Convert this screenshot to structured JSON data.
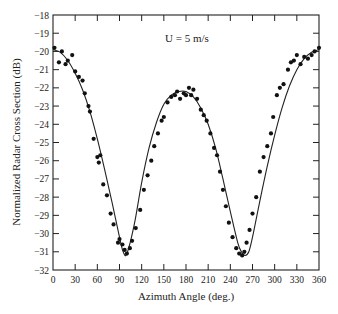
{
  "chart_data": {
    "type": "scatter",
    "title": "",
    "annotation": "U = 5 m/s",
    "xlabel": "Azimuth Angle (deg.)",
    "ylabel": "Normalized Radar Cross Section (dB)",
    "xlim": [
      0,
      360
    ],
    "ylim": [
      -32,
      -18
    ],
    "xticks": [
      0,
      30,
      60,
      90,
      120,
      150,
      180,
      210,
      240,
      270,
      300,
      330,
      360
    ],
    "yticks": [
      -18,
      -19,
      -20,
      -21,
      -22,
      -23,
      -24,
      -25,
      -26,
      -27,
      -28,
      -29,
      -30,
      -31,
      -32
    ],
    "grid": false,
    "legend": null,
    "series": [
      {
        "name": "Measured",
        "kind": "points",
        "x": [
          2,
          8,
          12,
          17,
          20,
          26,
          30,
          35,
          40,
          43,
          48,
          50,
          55,
          60,
          62,
          64,
          68,
          73,
          78,
          82,
          88,
          90,
          94,
          97,
          100,
          104,
          107,
          112,
          118,
          123,
          128,
          133,
          137,
          142,
          147,
          150,
          155,
          160,
          165,
          168,
          172,
          177,
          180,
          184,
          187,
          190,
          195,
          200,
          204,
          208,
          213,
          218,
          222,
          226,
          230,
          234,
          238,
          243,
          248,
          252,
          256,
          259,
          262,
          266,
          270,
          275,
          280,
          285,
          290,
          295,
          298,
          303,
          307,
          312,
          318,
          322,
          326,
          330,
          335,
          340,
          345,
          350,
          354,
          360
        ],
        "y": [
          -19.8,
          -20.6,
          -20.0,
          -20.7,
          -20.5,
          -20.2,
          -21.1,
          -21.4,
          -21.6,
          -22.3,
          -23.0,
          -23.3,
          -24.8,
          -25.8,
          -26.1,
          -25.7,
          -27.3,
          -27.9,
          -28.9,
          -29.5,
          -30.5,
          -30.3,
          -30.6,
          -30.9,
          -31.1,
          -30.8,
          -30.4,
          -29.7,
          -28.7,
          -27.6,
          -26.8,
          -26.0,
          -25.2,
          -24.5,
          -23.8,
          -23.6,
          -22.8,
          -22.5,
          -22.4,
          -22.2,
          -22.6,
          -22.3,
          -22.4,
          -22.0,
          -22.4,
          -22.1,
          -22.6,
          -23.2,
          -23.5,
          -23.8,
          -24.5,
          -25.3,
          -25.7,
          -26.6,
          -27.6,
          -28.5,
          -29.4,
          -30.2,
          -30.8,
          -31.1,
          -31.2,
          -31.0,
          -30.5,
          -29.8,
          -28.9,
          -28.0,
          -26.6,
          -25.8,
          -25.2,
          -24.5,
          -23.6,
          -22.4,
          -22.0,
          -21.8,
          -21.0,
          -20.6,
          -20.5,
          -20.2,
          -20.7,
          -20.3,
          -20.4,
          -20.2,
          -20.0,
          -19.8
        ]
      },
      {
        "name": "Model",
        "kind": "line",
        "x": [
          0,
          10,
          20,
          30,
          40,
          50,
          60,
          70,
          80,
          90,
          95,
          100,
          110,
          120,
          130,
          140,
          150,
          160,
          170,
          180,
          190,
          200,
          210,
          220,
          230,
          240,
          250,
          255,
          260,
          265,
          270,
          280,
          290,
          300,
          310,
          320,
          330,
          340,
          350,
          360
        ],
        "y": [
          -19.9,
          -20.05,
          -20.5,
          -21.2,
          -22.1,
          -23.3,
          -24.8,
          -26.5,
          -28.3,
          -30.2,
          -31.0,
          -31.1,
          -29.5,
          -27.2,
          -25.3,
          -23.9,
          -22.9,
          -22.4,
          -22.2,
          -22.2,
          -22.5,
          -23.1,
          -24.0,
          -25.3,
          -27.0,
          -28.8,
          -30.5,
          -31.0,
          -31.2,
          -31.0,
          -30.2,
          -28.2,
          -26.3,
          -24.6,
          -23.1,
          -21.9,
          -21.0,
          -20.4,
          -20.05,
          -19.9
        ]
      }
    ]
  }
}
